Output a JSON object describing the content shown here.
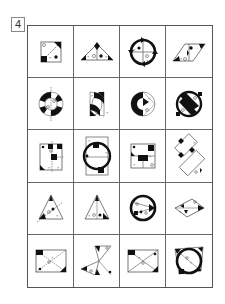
{
  "question": {
    "number": "4"
  },
  "grid": {
    "rows": 5,
    "cols": 4,
    "cells": [
      {
        "row": 1,
        "col": 1,
        "figure": "square-with-diagonal-corner-marks"
      },
      {
        "row": 1,
        "col": 2,
        "figure": "triangle-with-marks"
      },
      {
        "row": 1,
        "col": 3,
        "figure": "ring-with-cross-and-arrows"
      },
      {
        "row": 1,
        "col": 4,
        "figure": "parallelogram-with-marks"
      },
      {
        "row": 2,
        "col": 1,
        "figure": "segmented-ring-with-axis"
      },
      {
        "row": 2,
        "col": 2,
        "figure": "two-half-discs"
      },
      {
        "row": 2,
        "col": 3,
        "figure": "segmented-disc"
      },
      {
        "row": 2,
        "col": 4,
        "figure": "ring-with-s-band"
      },
      {
        "row": 3,
        "col": 1,
        "figure": "rectangle-with-dashed-axis"
      },
      {
        "row": 3,
        "col": 2,
        "figure": "ring-over-rectangle"
      },
      {
        "row": 3,
        "col": 3,
        "figure": "rectangle-with-blocks"
      },
      {
        "row": 3,
        "col": 4,
        "figure": "two-tilted-rectangles"
      },
      {
        "row": 4,
        "col": 1,
        "figure": "triangle-with-dashed-line"
      },
      {
        "row": 4,
        "col": 2,
        "figure": "triangle-with-inner-marks"
      },
      {
        "row": 4,
        "col": 3,
        "figure": "ring-with-arrow"
      },
      {
        "row": 4,
        "col": 4,
        "figure": "rhombus-with-arrow"
      },
      {
        "row": 5,
        "col": 1,
        "figure": "rectangle-with-dashed-diagonals"
      },
      {
        "row": 5,
        "col": 2,
        "figure": "crossed-triangles"
      },
      {
        "row": 5,
        "col": 3,
        "figure": "rectangle-with-diagonals"
      },
      {
        "row": 5,
        "col": 4,
        "figure": "ring-over-square"
      }
    ]
  }
}
